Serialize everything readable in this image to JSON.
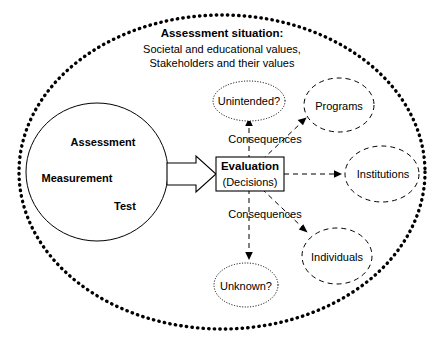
{
  "diagram": {
    "title_block": {
      "heading": "Assessment situation:",
      "line2": "Societal and educational values,",
      "line3": "Stakeholders and their values"
    },
    "source_circle": {
      "labels": [
        "Assessment",
        "Measurement",
        "Test"
      ]
    },
    "evaluation_box": {
      "title": "Evaluation",
      "subtitle": "(Decisions)"
    },
    "consequence_labels": [
      "Consequences",
      "Consequences"
    ],
    "outcome_nodes": [
      {
        "label": "Unintended?",
        "style": "dotted"
      },
      {
        "label": "Programs",
        "style": "dashed"
      },
      {
        "label": "Institutions",
        "style": "dashed"
      },
      {
        "label": "Individuals",
        "style": "dashed"
      },
      {
        "label": "Unknown?",
        "style": "dotted"
      }
    ],
    "colors": {
      "stroke": "#000000",
      "text": "#000000",
      "fill": "#ffffff"
    }
  }
}
